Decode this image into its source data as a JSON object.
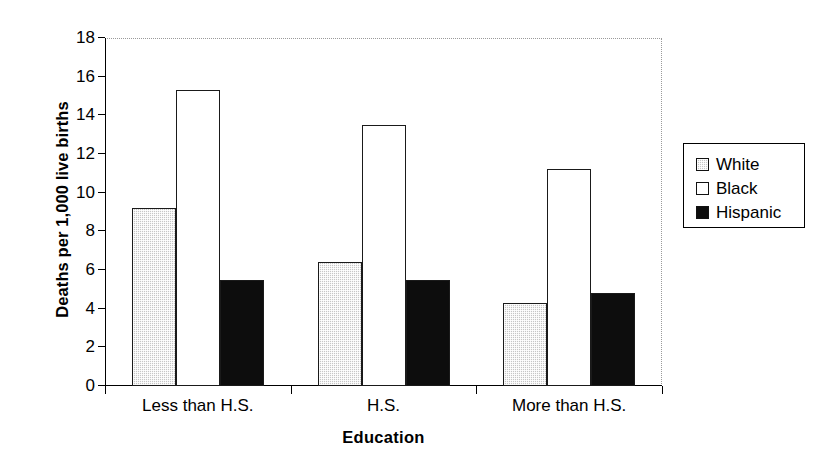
{
  "chart_data": {
    "type": "bar",
    "title": "",
    "subtitle": "",
    "xlabel": "Education",
    "ylabel": "Deaths per 1,000 live births",
    "categories": [
      "Less than H.S.",
      "H.S.",
      "More than H.S."
    ],
    "series": [
      {
        "name": "White",
        "values": [
          9.2,
          6.4,
          4.3
        ]
      },
      {
        "name": "Black",
        "values": [
          15.3,
          13.5,
          11.25
        ]
      },
      {
        "name": "Hispanic",
        "values": [
          5.5,
          5.5,
          4.8
        ]
      }
    ],
    "ylim": [
      0,
      18
    ],
    "yticks": [
      0,
      2,
      4,
      6,
      8,
      10,
      12,
      14,
      16,
      18
    ],
    "ytick_labels": [
      "0",
      "2",
      "4",
      "6",
      "8",
      "10",
      "12",
      "14",
      "16",
      "18"
    ],
    "grid": false,
    "legend_position": "right",
    "annotations": []
  },
  "axes": {
    "y_title": "Deaths per 1,000 live births",
    "x_title": "Education"
  },
  "legend": {
    "entries": [
      {
        "label": "White",
        "fill": "#c6c6c6",
        "style": "dotted-gray"
      },
      {
        "label": "Black",
        "fill": "#ffffff",
        "style": "open-white"
      },
      {
        "label": "Hispanic",
        "fill": "#0d0d0d",
        "style": "solid-black"
      }
    ]
  },
  "colors": {
    "axis": "#000000",
    "frame_dotted": "#9a9a9a",
    "series_white": "#c6c6c6",
    "series_black": "#ffffff",
    "series_hispanic": "#0d0d0d",
    "background": "#ffffff"
  }
}
